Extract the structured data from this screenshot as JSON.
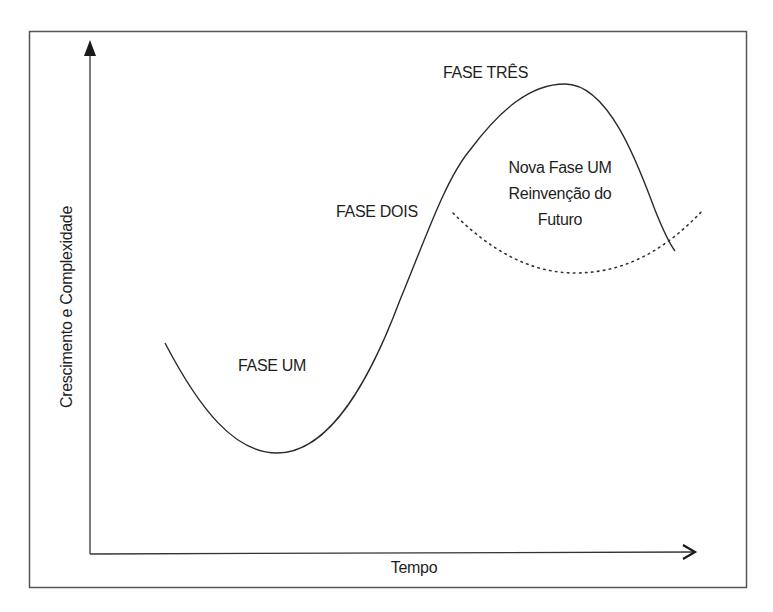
{
  "diagram": {
    "axes": {
      "y_label": "Crescimento e Complexidade",
      "x_label": "Tempo"
    },
    "phases": [
      {
        "label": "FASE UM"
      },
      {
        "label": "FASE DOIS"
      },
      {
        "label": "FASE TRÊS"
      }
    ],
    "new_phase": {
      "lines": [
        "Nova Fase UM",
        "Reinvenção do",
        "Futuro"
      ]
    },
    "curves": [
      {
        "name": "main-s-curve",
        "style": "solid"
      },
      {
        "name": "reinvention-curve",
        "style": "dotted"
      }
    ],
    "colors": {
      "line": "#2a2a2a",
      "frame": "#555555",
      "background": "#ffffff"
    }
  }
}
